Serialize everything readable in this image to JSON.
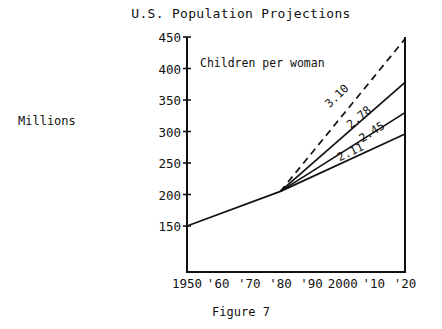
{
  "chart_data": {
    "type": "line",
    "title": "U.S. Population Projections",
    "caption": "Figure 7",
    "ylabel": "Millions",
    "xlabel": "",
    "annotation": "Children per woman",
    "grid": false,
    "legend_position": "inline-end-labels",
    "xlim": [
      1950,
      2020
    ],
    "ylim": [
      77,
      450
    ],
    "yticks": [
      450,
      400,
      350,
      300,
      250,
      200,
      150
    ],
    "ytick_labels": [
      "450",
      "400",
      "350",
      "300",
      "250",
      "200",
      "150"
    ],
    "xticks": [
      1950,
      1960,
      1970,
      1980,
      1990,
      2000,
      2010,
      2020
    ],
    "xtick_labels": [
      "1950",
      "'60",
      "'70",
      "'80",
      "'90",
      "2000",
      "'10",
      "'20"
    ],
    "history": {
      "name": "historical",
      "style": "solid",
      "x": [
        1950,
        1980
      ],
      "values": [
        150,
        205
      ]
    },
    "series": [
      {
        "name": "3.10",
        "label": "3.10",
        "style": "dashed",
        "x": [
          1980,
          2020
        ],
        "values": [
          205,
          447
        ]
      },
      {
        "name": "2.78",
        "label": "2.78",
        "style": "solid",
        "x": [
          1980,
          2020
        ],
        "values": [
          205,
          378
        ]
      },
      {
        "name": "2.45",
        "label": "2.45",
        "style": "solid",
        "x": [
          1980,
          2020
        ],
        "values": [
          205,
          330
        ]
      },
      {
        "name": "2.11",
        "label": "2.11",
        "style": "solid",
        "x": [
          1980,
          2020
        ],
        "values": [
          205,
          296
        ]
      }
    ],
    "series_label_positions": [
      {
        "x": 1999,
        "y": 352,
        "rotate": -44
      },
      {
        "x": 2006,
        "y": 318,
        "rotate": -40
      },
      {
        "x": 2010,
        "y": 294,
        "rotate": -33
      },
      {
        "x": 2003,
        "y": 262,
        "rotate": -26
      }
    ],
    "colors": {
      "line": "#111111",
      "axis": "#111111",
      "background": "#ffffff"
    }
  }
}
